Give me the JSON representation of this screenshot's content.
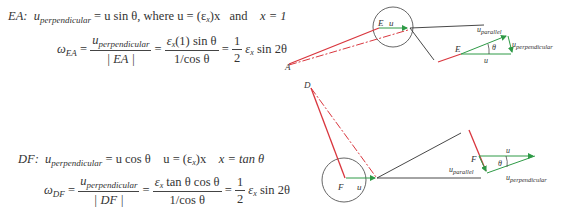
{
  "colors": {
    "red": "#d9363e",
    "green": "#2e9a46",
    "black": "#333333"
  },
  "ea": {
    "label": "EA:",
    "line1": {
      "u": "u",
      "perp_sub": "perpendicular",
      "eq1": " = u sin θ, where u = (ε",
      "x_sub": "x",
      "eq2": ")x",
      "and": "and",
      "x_eq": "x = 1"
    },
    "line2": {
      "omega": "ω",
      "omega_sub": "EA",
      "eq": " = ",
      "num1_u": "u",
      "num1_sub": "perpendicular",
      "den1": "| EA |",
      "num2": "ε",
      "num2_sub": "x",
      "num2_rest": "(1) sin θ",
      "den2": "1/cos θ",
      "half_num": "1",
      "half_den": "2",
      "tail_eps": "ε",
      "tail_sub": "x",
      "tail_rest": " sin 2θ"
    }
  },
  "df": {
    "label": "DF:",
    "line1": {
      "u": "u",
      "perp_sub": "perpendicular",
      "eq1": " = u cos θ",
      "eq2": "u = (ε",
      "x_sub": "x",
      "eq3": ")x",
      "x_eq": "x = tan θ"
    },
    "line2": {
      "omega": "ω",
      "omega_sub": "DF",
      "eq": " = ",
      "num1_u": "u",
      "num1_sub": "perpendicular",
      "den1": "| DF |",
      "num2": "ε",
      "num2_sub": "x",
      "num2_rest": " tan θ cos θ",
      "den2": "1/cos θ",
      "half_num": "1",
      "half_den": "2",
      "tail_eps": "ε",
      "tail_sub": "x",
      "tail_rest": " sin 2θ"
    }
  },
  "diagram": {
    "labels": {
      "A": "A",
      "E": "E",
      "D": "D",
      "F": "F",
      "u": "u",
      "theta": "θ",
      "u_parallel_u": "u",
      "u_parallel_sub": "parallel",
      "u_perp_u": "u",
      "u_perp_sub": "perpendicular"
    }
  }
}
